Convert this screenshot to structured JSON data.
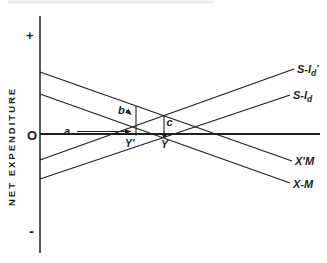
{
  "chart_data": {
    "type": "line",
    "title": "",
    "xlabel": "",
    "ylabel": "NET EXPENDITURE",
    "axis_note": "qualitative diagram, no numeric scale shown",
    "ink_color": "#1f1f1f",
    "y_axis": {
      "x": 40,
      "y_top": 16,
      "y_bottom": 253,
      "plus": "+",
      "minus": "-",
      "origin": "O"
    },
    "x_axis": {
      "y": 134,
      "x_left": 40,
      "x_right": 320
    },
    "series": [
      {
        "id": "s-id-prime",
        "label_main": "S-I",
        "label_sub": "d",
        "label_post": "'",
        "x1": 40,
        "y1": 160,
        "x2": 294,
        "y2": 69,
        "lx": 297,
        "ly": 73
      },
      {
        "id": "s-id",
        "label_main": "S-I",
        "label_sub": "d",
        "label_post": "",
        "x1": 40,
        "y1": 179,
        "x2": 290,
        "y2": 95,
        "lx": 293,
        "ly": 99
      },
      {
        "id": "x-prime-m",
        "label_main": "X'M",
        "label_sub": "",
        "label_post": "",
        "x1": 40,
        "y1": 72,
        "x2": 292,
        "y2": 161,
        "lx": 295,
        "ly": 165
      },
      {
        "id": "x-m",
        "label_main": "X-M",
        "label_sub": "",
        "label_post": "",
        "x1": 40,
        "y1": 94,
        "x2": 290,
        "y2": 183,
        "lx": 293,
        "ly": 188
      }
    ],
    "guides": [
      {
        "id": "y-prime-vertical",
        "x1": 136,
        "y1": 106,
        "x2": 136,
        "y2": 135.5
      },
      {
        "id": "c-vertical",
        "x1": 164,
        "y1": 116,
        "x2": 164,
        "y2": 134
      }
    ],
    "arrows": [
      {
        "id": "a-arrow",
        "x1": 77,
        "y1": 131.5,
        "x2": 130.5,
        "y2": 131.5
      },
      {
        "id": "b-arrow",
        "x1": 126,
        "y1": 110,
        "x2": 131,
        "y2": 114.5
      }
    ],
    "labels": [
      {
        "id": "a",
        "text": "a",
        "x": 64,
        "y": 135
      },
      {
        "id": "b",
        "text": "b",
        "x": 118,
        "y": 114
      },
      {
        "id": "c",
        "text": "c",
        "x": 166.5,
        "y": 126
      },
      {
        "id": "y-prime",
        "text": "Y'",
        "x": 125,
        "y": 147
      },
      {
        "id": "y",
        "text": "Y",
        "x": 161,
        "y": 148
      }
    ],
    "equilibrium_dot": {
      "x": 164.5,
      "y": 135,
      "r": 2.2
    },
    "scan_artifact": {
      "x": 8,
      "y": 0.5,
      "width": 205,
      "height": 3,
      "color": "#d8d8d5",
      "opacity": 0.55
    }
  }
}
